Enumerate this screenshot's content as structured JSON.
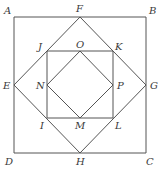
{
  "diagram": {
    "stroke_color": "#555555",
    "label_color": "#3a3a3a",
    "points": {
      "A": [
        14,
        17
      ],
      "B": [
        146,
        17
      ],
      "C": [
        146,
        153
      ],
      "D": [
        14,
        153
      ],
      "F": [
        80,
        17
      ],
      "G": [
        146,
        85
      ],
      "H": [
        80,
        153
      ],
      "E": [
        14,
        85
      ],
      "J": [
        47,
        51
      ],
      "K": [
        113,
        51
      ],
      "L": [
        113,
        118
      ],
      "I": [
        47,
        118
      ],
      "O": [
        80,
        51
      ],
      "P": [
        113,
        85
      ],
      "M": [
        80,
        118
      ],
      "N": [
        47,
        85
      ]
    },
    "squares": [
      {
        "name": "outer-square-ABCD",
        "vertices": [
          "A",
          "B",
          "C",
          "D"
        ]
      },
      {
        "name": "diamond-FGHE",
        "vertices": [
          "F",
          "G",
          "H",
          "E"
        ]
      },
      {
        "name": "square-JKLI",
        "vertices": [
          "J",
          "K",
          "L",
          "I"
        ]
      },
      {
        "name": "diamond-OPMN",
        "vertices": [
          "O",
          "P",
          "M",
          "N"
        ]
      }
    ],
    "labels": [
      {
        "text": "A",
        "x": 4,
        "y": 14
      },
      {
        "text": "F",
        "x": 76,
        "y": 12
      },
      {
        "text": "B",
        "x": 149,
        "y": 14
      },
      {
        "text": "J",
        "x": 38,
        "y": 50
      },
      {
        "text": "O",
        "x": 76,
        "y": 48
      },
      {
        "text": "K",
        "x": 115,
        "y": 50
      },
      {
        "text": "E",
        "x": 3,
        "y": 89
      },
      {
        "text": "N",
        "x": 36,
        "y": 89
      },
      {
        "text": "P",
        "x": 117,
        "y": 89
      },
      {
        "text": "G",
        "x": 150,
        "y": 89
      },
      {
        "text": "I",
        "x": 40,
        "y": 129
      },
      {
        "text": "M",
        "x": 75,
        "y": 129
      },
      {
        "text": "L",
        "x": 115,
        "y": 129
      },
      {
        "text": "D",
        "x": 5,
        "y": 165
      },
      {
        "text": "H",
        "x": 76,
        "y": 165
      },
      {
        "text": "C",
        "x": 146,
        "y": 165
      }
    ]
  }
}
